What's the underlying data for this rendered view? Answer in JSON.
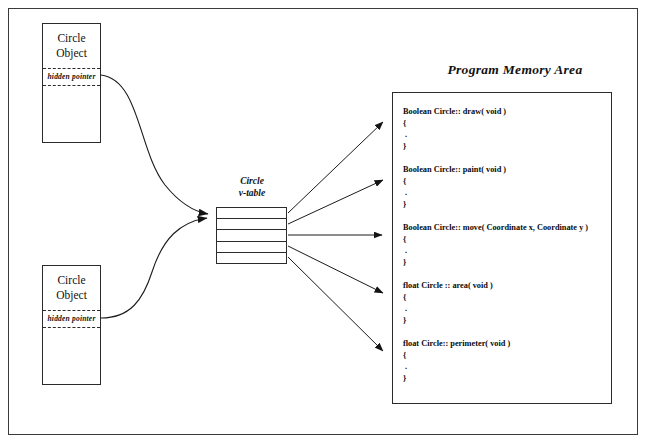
{
  "diagram": {
    "title_label": "Program Memory Area",
    "objects": [
      {
        "name": "circle-object-top",
        "title_line1": "Circle",
        "title_line2": "Object",
        "pointer_label": "hidden pointer"
      },
      {
        "name": "circle-object-bottom",
        "title_line1": "Circle",
        "title_line2": "Object",
        "pointer_label": "hidden pointer"
      }
    ],
    "vtable": {
      "label_line1": "Circle",
      "label_line2": "v-table",
      "slot_count": 5,
      "slots": [
        "",
        "",
        "",
        "",
        ""
      ]
    },
    "memory_area": {
      "functions": [
        {
          "signature": "Boolean Circle:: draw( void )",
          "open_brace": "{",
          "body": ".",
          "close_brace": "}"
        },
        {
          "signature": "Boolean Circle::  paint( void )",
          "open_brace": "{",
          "body": ".",
          "close_brace": "}"
        },
        {
          "signature": "Boolean Circle::  move( Coordinate x, Coordinate  y )",
          "open_brace": "{",
          "body": ".",
          "close_brace": "}"
        },
        {
          "signature": "float Circle :: area( void )",
          "open_brace": "{",
          "body": ".",
          "close_brace": "}"
        },
        {
          "signature": "float Circle:: perimeter( void )",
          "open_brace": "{",
          "body": ".",
          "close_brace": "}"
        }
      ]
    },
    "colors": {
      "stroke": "#2b2b2b",
      "frame": "#3a3a3a",
      "text": "#111111",
      "background": "#ffffff"
    }
  }
}
